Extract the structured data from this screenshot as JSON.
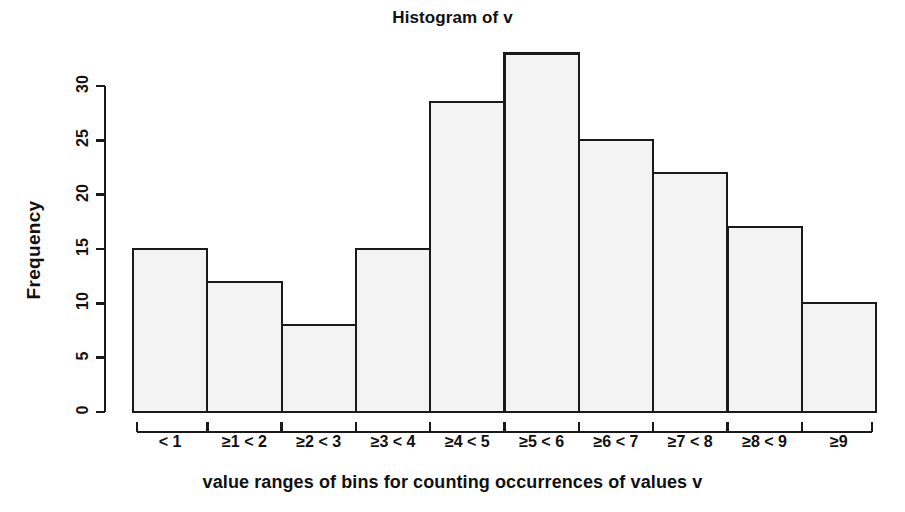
{
  "chart_data": {
    "type": "bar",
    "title": "Histogram of v",
    "xlabel": "value ranges of bins for counting occurrences of values v",
    "ylabel": "Frequency",
    "categories": [
      "< 1",
      "≥1 < 2",
      "≥2 < 3",
      "≥3 < 4",
      "≥4 < 5",
      "≥5 < 6",
      "≥6 < 7",
      "≥7 < 8",
      "≥8 < 9",
      "≥9"
    ],
    "values": [
      15,
      12,
      8,
      15,
      28.5,
      33,
      25,
      22,
      17,
      10
    ],
    "ylim": [
      0,
      33.5
    ],
    "yticks": [
      0,
      5,
      10,
      15,
      20,
      25,
      30
    ],
    "ytick_labels": [
      "0",
      "5",
      "10",
      "15",
      "20",
      "25",
      "30"
    ],
    "xlim_bins": 10,
    "grid": false,
    "legend": null,
    "bar_fill": "#f3f3f3",
    "bar_stroke": "#1a1a1a",
    "axis_color": "#1a1a1a"
  }
}
